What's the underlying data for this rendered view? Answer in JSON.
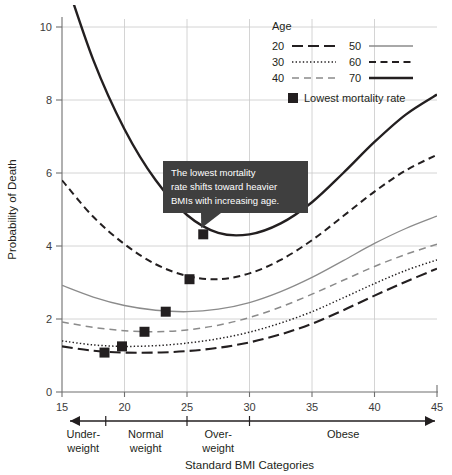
{
  "chart_data": {
    "type": "line",
    "title": "",
    "xlabel": "Standard BMI Categories",
    "ylabel": "Probability of Death",
    "xlim": [
      15,
      45
    ],
    "ylim": [
      0,
      10
    ],
    "xticks": [
      15,
      20,
      25,
      30,
      35,
      40,
      45
    ],
    "yticks": [
      0,
      2,
      4,
      6,
      8,
      10
    ],
    "grid": true,
    "legend_position": "top-right",
    "legend_title": "Age",
    "x": [
      15,
      17.5,
      20,
      22.5,
      25,
      27.5,
      30,
      32.5,
      35,
      37.5,
      40,
      42.5,
      45
    ],
    "series": [
      {
        "name": "20",
        "style": "long-dash",
        "width": 2.1,
        "color": "#231f20",
        "values": [
          1.25,
          1.13,
          1.08,
          1.08,
          1.12,
          1.21,
          1.36,
          1.58,
          1.87,
          2.24,
          2.64,
          3.02,
          3.38
        ]
      },
      {
        "name": "30",
        "style": "dotted",
        "width": 1.5,
        "color": "#231f20",
        "values": [
          1.4,
          1.29,
          1.25,
          1.27,
          1.34,
          1.46,
          1.64,
          1.89,
          2.2,
          2.58,
          2.97,
          3.33,
          3.62
        ]
      },
      {
        "name": "40",
        "style": "dashed",
        "width": 1.5,
        "color": "#8b8b8b",
        "values": [
          1.92,
          1.77,
          1.68,
          1.65,
          1.7,
          1.83,
          2.04,
          2.33,
          2.68,
          3.06,
          3.44,
          3.77,
          4.05
        ]
      },
      {
        "name": "50",
        "style": "solid-thin",
        "width": 1.3,
        "color": "#8b8b8b",
        "values": [
          2.92,
          2.6,
          2.37,
          2.24,
          2.2,
          2.27,
          2.45,
          2.75,
          3.14,
          3.6,
          4.07,
          4.48,
          4.82
        ]
      },
      {
        "name": "60",
        "style": "medium-dash",
        "width": 2.0,
        "color": "#231f20",
        "values": [
          5.8,
          4.8,
          4.05,
          3.5,
          3.18,
          3.09,
          3.25,
          3.62,
          4.16,
          4.82,
          5.49,
          6.07,
          6.5
        ]
      },
      {
        "name": "70",
        "style": "solid-thick",
        "width": 2.4,
        "color": "#231f20",
        "values": [
          11.6,
          9.1,
          7.2,
          5.8,
          4.85,
          4.36,
          4.32,
          4.62,
          5.2,
          6.0,
          6.85,
          7.6,
          8.15
        ]
      }
    ],
    "markers": {
      "label": "Lowest mortality rate",
      "points": [
        {
          "series": "20",
          "x": 18.4,
          "y": 1.08
        },
        {
          "series": "30",
          "x": 19.8,
          "y": 1.25
        },
        {
          "series": "40",
          "x": 21.6,
          "y": 1.65
        },
        {
          "series": "50",
          "x": 23.3,
          "y": 2.2
        },
        {
          "series": "60",
          "x": 25.2,
          "y": 3.09
        },
        {
          "series": "70",
          "x": 26.3,
          "y": 4.32
        }
      ]
    },
    "annotation": {
      "lines": [
        "The lowest mortality",
        "rate shifts toward heavier",
        "BMIs with increasing age."
      ],
      "points_to_series": "70"
    },
    "categories_axis": {
      "label": "Standard BMI Categories",
      "divider_values": [
        18.5,
        25,
        30
      ],
      "items": [
        {
          "line1": "Under-",
          "line2": "weight",
          "center": 16.7
        },
        {
          "line1": "Normal",
          "line2": "weight",
          "center": 21.7
        },
        {
          "line1": "Over-",
          "line2": "weight",
          "center": 27.5
        },
        {
          "line1": "Obese",
          "line2": "",
          "center": 37.5
        }
      ]
    }
  },
  "legend": {
    "title": "Age",
    "entries": [
      {
        "label": "20",
        "col": 0,
        "row": 0
      },
      {
        "label": "30",
        "col": 0,
        "row": 1
      },
      {
        "label": "40",
        "col": 0,
        "row": 2
      },
      {
        "label": "50",
        "col": 1,
        "row": 0
      },
      {
        "label": "60",
        "col": 1,
        "row": 1
      },
      {
        "label": "70",
        "col": 1,
        "row": 2
      }
    ],
    "marker_label": "Lowest mortality rate"
  },
  "colors": {
    "ink": "#231f20",
    "grey_line": "#8b8b8b",
    "grid": "#c9c9c9",
    "axis": "#6f6f6f",
    "annotation_bg": "#3f3f3f",
    "annotation_fg": "#ffffff"
  }
}
